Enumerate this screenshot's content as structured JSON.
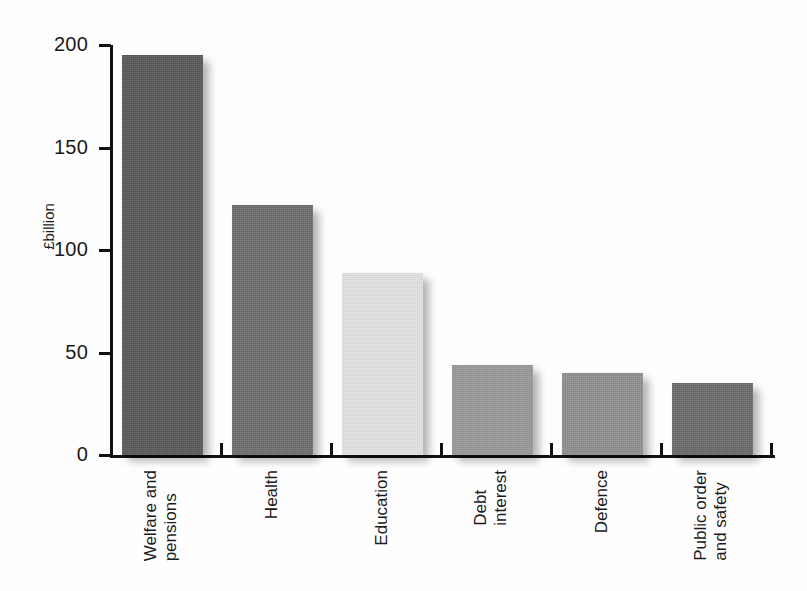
{
  "chart_data": {
    "type": "bar",
    "title": "",
    "subtitle": "",
    "xlabel": "",
    "ylabel": "£billion",
    "ylim": [
      0,
      200
    ],
    "yticks": [
      0,
      50,
      100,
      150,
      200
    ],
    "ytick_labels": [
      "0",
      "50",
      "100",
      "150",
      "200"
    ],
    "grid": false,
    "legend": false,
    "categories": [
      "Welfare and pensions",
      "Health",
      "Education",
      "Debt interest",
      "Defence",
      "Public order and safety"
    ],
    "category_lines": [
      [
        "Welfare and",
        "pensions"
      ],
      [
        "Health"
      ],
      [
        "Education"
      ],
      [
        "Debt",
        "interest"
      ],
      [
        "Defence"
      ],
      [
        "Public order",
        "and safety"
      ]
    ],
    "values": [
      195,
      122,
      89,
      44,
      40,
      35
    ],
    "bar_colors": [
      "#595959",
      "#6e6e6e",
      "#e3e3e3",
      "#999999",
      "#909090",
      "#6a6a6a"
    ],
    "units": "£billion"
  },
  "axis": {
    "y_title": "£billion"
  }
}
